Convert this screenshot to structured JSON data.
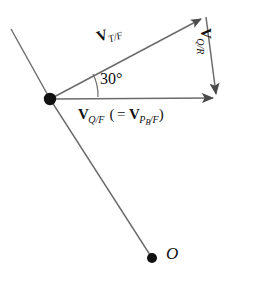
{
  "figure": {
    "type": "vector-triangle-diagram",
    "background_color": "#ffffff",
    "stroke_color": "#555555",
    "text_color": "#111111"
  },
  "labels": {
    "v_tf": {
      "vector": "V",
      "subscript": "T/F",
      "full": "V_T/F",
      "rotation_deg": -18
    },
    "v_qr": {
      "vector": "V",
      "subscript": "Q/R",
      "full": "V_Q/R",
      "rotation_deg": 90
    },
    "v_qf": {
      "vector": "V",
      "subscript": "Q/F",
      "open_paren": "(",
      "equals": "=",
      "vector2": "V",
      "subscript2_main": "P",
      "subscript2_sub": "B",
      "subscript2_tail": "/F",
      "close_paren": ")",
      "full": "V_Q/F ( = V_P_B/F )"
    },
    "angle": "30°",
    "origin_point": "O"
  },
  "geometry": {
    "vertex": {
      "x": 50,
      "y": 99
    },
    "apex": {
      "x": 206,
      "y": 16
    },
    "right_tip": {
      "x": 219,
      "y": 98
    },
    "origin_dot": {
      "x": 152,
      "y": 258
    },
    "upper_left_end": {
      "x": 11,
      "y": 29
    },
    "angle_value_deg": 30
  },
  "icons": {
    "vertex_dot": "filled-dot-icon",
    "origin_dot": "filled-dot-icon",
    "arrowhead_tf": "arrowhead-icon",
    "arrowhead_qf": "arrowhead-icon",
    "arrowhead_qr": "arrowhead-icon"
  }
}
